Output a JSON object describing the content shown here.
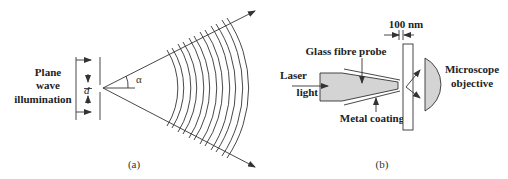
{
  "panel_a": {
    "caption": "(a)",
    "illumination_label": [
      "Plane",
      "wave",
      "illumination"
    ],
    "aperture_label": "d",
    "angle_label": "α"
  },
  "panel_b": {
    "caption": "(b)",
    "gap_label": "100 nm",
    "probe_label": "Glass fibre probe",
    "laser_label": [
      "Laser",
      "light"
    ],
    "coating_label": "Metal coating",
    "objective_label": [
      "Microscope",
      "objective"
    ]
  },
  "colors": {
    "line": "#333333",
    "fill": "#d4d4d4",
    "background": "#ffffff"
  }
}
